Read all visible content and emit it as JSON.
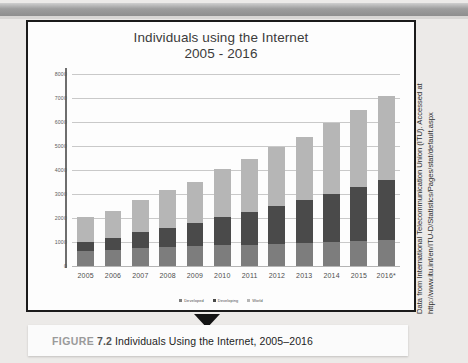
{
  "figure": {
    "caption_prefix": "FIGURE",
    "caption_number": "7.2",
    "caption_text": "Individuals Using the Internet, 2005–2016"
  },
  "credit": {
    "line1": "Data from International Telecommunication Union (ITU). Accessed at",
    "line2": "http://www.itu.int/en/ITU-D/Statistics/Pages/stat/default.aspx"
  },
  "chart_data": {
    "type": "bar",
    "stacked": true,
    "title": "Individuals using the Internet",
    "subtitle": "2005 - 2016",
    "xlabel": "",
    "ylabel": "",
    "ylim": [
      0,
      8000
    ],
    "yticks": [
      0,
      1000,
      2000,
      3000,
      4000,
      5000,
      6000,
      7000,
      8000
    ],
    "ytick_labels": [
      "0",
      "1000",
      "2000",
      "3000",
      "4000",
      "5000",
      "6000",
      "7000",
      "8000"
    ],
    "grid": true,
    "legend_position": "bottom",
    "categories": [
      "2005",
      "2006",
      "2007",
      "2008",
      "2009",
      "2010",
      "2011",
      "2012",
      "2013",
      "2014",
      "2015",
      "2016*"
    ],
    "series": [
      {
        "name": "Developed",
        "color": "#7d7d7d",
        "values": [
          620,
          660,
          730,
          790,
          820,
          860,
          880,
          930,
          960,
          1000,
          1030,
          1100
        ]
      },
      {
        "name": "Developing",
        "color": "#4a4a4a",
        "values": [
          400,
          500,
          670,
          800,
          960,
          1200,
          1370,
          1590,
          1770,
          2000,
          2250,
          2470
        ]
      },
      {
        "name": "World",
        "color": "#b6b6b6",
        "values": [
          1030,
          1150,
          1350,
          1560,
          1740,
          1990,
          2200,
          2430,
          2630,
          2950,
          3220,
          3530
        ]
      }
    ],
    "totals": [
      2050,
      2310,
      2750,
      3150,
      3520,
      4050,
      4450,
      4950,
      5360,
      5950,
      6500,
      7100
    ]
  }
}
